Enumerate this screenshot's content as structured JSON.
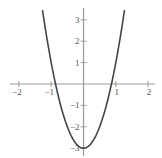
{
  "chart_data": {
    "type": "line",
    "title": "",
    "xlabel": "",
    "ylabel": "",
    "function": "y = 4x^2 - 3",
    "xlim": [
      -2.3,
      2.3
    ],
    "ylim": [
      -3.1,
      3.5
    ],
    "grid": false,
    "legend": null,
    "x_ticks": [
      -2,
      -1,
      1,
      2
    ],
    "x_tick_labels": [
      "−2",
      "−1",
      "1",
      "2"
    ],
    "y_ticks": [
      -3,
      -2,
      -1,
      1,
      2,
      3
    ],
    "y_tick_labels": [
      "−3",
      "−2",
      "−1",
      "1",
      "2",
      "3"
    ],
    "series": [
      {
        "name": "parabola",
        "color": "#444444",
        "x": [
          -1.27,
          -1.0,
          -0.866,
          -0.5,
          0,
          0.5,
          0.866,
          1.0,
          1.27
        ],
        "y": [
          3.45,
          1.0,
          0.0,
          -2.0,
          -3.0,
          -2.0,
          0.0,
          1.0,
          3.45
        ]
      }
    ],
    "axis_color": "#999999"
  }
}
